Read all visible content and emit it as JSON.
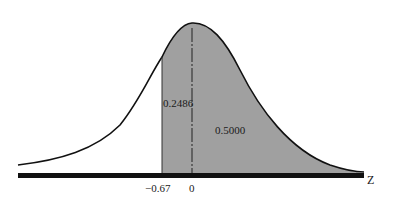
{
  "diagram": {
    "type": "normal-distribution-shaded-area",
    "axis_label": "Z",
    "ticks": [
      {
        "label": "−0.67",
        "z": -0.67
      },
      {
        "label": "0",
        "z": 0
      }
    ],
    "areas": [
      {
        "label": "0.2486",
        "from_z": -0.67,
        "to_z": 0
      },
      {
        "label": "0.5000",
        "from_z": 0,
        "to_z": "infinity"
      }
    ],
    "colors": {
      "shade": "#a0a0a0",
      "curve": "#111111",
      "axis": "#111111",
      "background": "#ffffff"
    }
  }
}
